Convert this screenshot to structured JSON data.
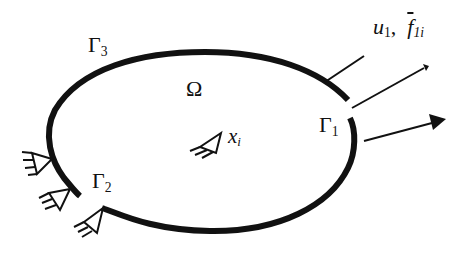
{
  "figure": {
    "type": "elastic domain boundary diagram",
    "domain_label": "Ω",
    "interior_point": {
      "symbol": "x",
      "subscript": "i"
    },
    "boundaries": [
      {
        "id": "gamma1",
        "symbol": "Γ",
        "subscript": "1"
      },
      {
        "id": "gamma2",
        "symbol": "Γ",
        "subscript": "2"
      },
      {
        "id": "gamma3",
        "symbol": "Γ",
        "subscript": "3"
      }
    ],
    "load_label": {
      "u_symbol": "u",
      "u_subscript": "1",
      "separator": ",",
      "f_symbol": "f",
      "f_subscript": "1i"
    },
    "supports_count": 3
  },
  "colors": {
    "stroke": "#111111",
    "background": "#ffffff"
  }
}
